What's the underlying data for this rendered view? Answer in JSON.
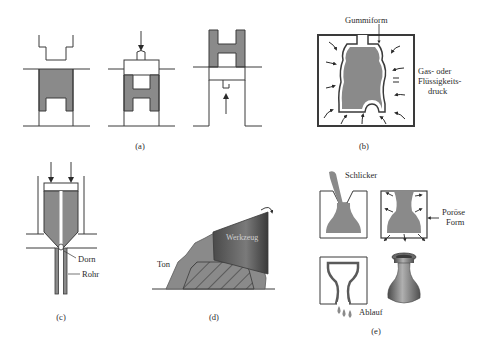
{
  "figure": {
    "panels": [
      {
        "id": "a",
        "caption": "(a)",
        "process": "die pressing (three stages)",
        "labels": []
      },
      {
        "id": "b",
        "caption": "(b)",
        "process": "isostatic pressing",
        "labels": [
          "Gummiform",
          "Gas- oder",
          "Flüssigkeits-",
          "druck"
        ]
      },
      {
        "id": "c",
        "caption": "(c)",
        "process": "extrusion",
        "labels": [
          "Dorn",
          "Rohr"
        ]
      },
      {
        "id": "d",
        "caption": "(d)",
        "process": "jiggering",
        "labels": [
          "Werkzeug",
          "Ton"
        ]
      },
      {
        "id": "e",
        "caption": "(e)",
        "process": "slip casting",
        "labels": [
          "Schlicker",
          "Poröse",
          "Form",
          "Ablauf"
        ]
      }
    ]
  },
  "labels": {
    "a_caption": "(a)",
    "b_gummiform": "Gummiform",
    "b_pressure_1": "Gas- oder",
    "b_pressure_2": "Flüssigkeits-",
    "b_pressure_3": "druck",
    "b_caption": "(b)",
    "c_dorn": "Dorn",
    "c_rohr": "Rohr",
    "c_caption": "(c)",
    "d_werkzeug": "Werkzeug",
    "d_ton": "Ton",
    "d_caption": "(d)",
    "e_schlicker": "Schlicker",
    "e_poroese_1": "Poröse",
    "e_poroese_2": "Form",
    "e_ablauf": "Ablauf",
    "e_caption": "(e)"
  },
  "colors": {
    "fill": "#8a8a8a",
    "line": "#3a3a3a",
    "tool_dark": "#555555",
    "background": "#ffffff"
  }
}
